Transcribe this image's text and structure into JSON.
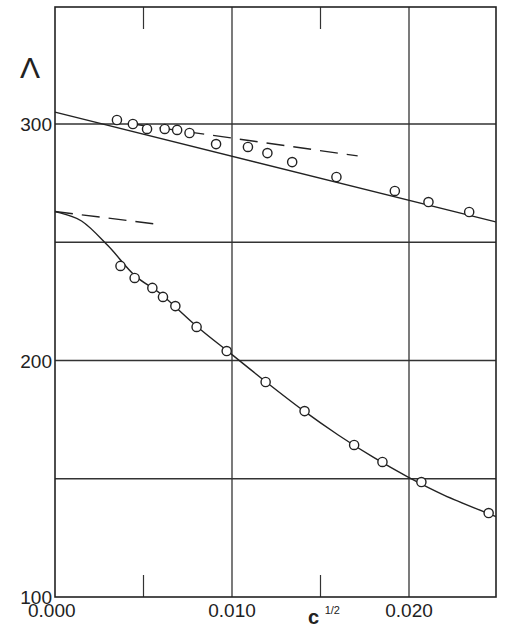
{
  "chart_data": {
    "type": "line",
    "title": "",
    "xlabel": "c^1/2",
    "xlabel_base": "c",
    "xlabel_sup": "1/2",
    "ylabel": "Λ",
    "xlim": [
      0.0,
      0.025
    ],
    "ylim": [
      100,
      350
    ],
    "grid": true,
    "legend": null,
    "x_ticks": [
      {
        "value": 0.0,
        "label": "0.000"
      },
      {
        "value": 0.01,
        "label": "0.010"
      },
      {
        "value": 0.02,
        "label": "0.020"
      }
    ],
    "x_minor_ticks": [
      0.005,
      0.015
    ],
    "y_ticks": [
      {
        "value": 100,
        "label": "100"
      },
      {
        "value": 200,
        "label": "200"
      },
      {
        "value": 300,
        "label": "300"
      }
    ],
    "y_gridlines": [
      150,
      250,
      300,
      200
    ],
    "x_gridlines": [
      0.01,
      0.02
    ],
    "series": [
      {
        "name": "upper-data",
        "marker": "open-circle",
        "x": [
          0.0035,
          0.0044,
          0.0052,
          0.0062,
          0.0069,
          0.0076,
          0.0091,
          0.0109,
          0.012,
          0.0134,
          0.0159,
          0.0192,
          0.0211,
          0.0234
        ],
        "y": [
          301.7,
          300.0,
          297.9,
          297.9,
          297.5,
          296.2,
          291.5,
          290.3,
          287.7,
          283.9,
          277.6,
          271.7,
          267.0,
          262.8
        ]
      },
      {
        "name": "upper-fit",
        "style": "solid",
        "x": [
          0.0,
          0.0249
        ],
        "y": [
          305.0,
          258.6
        ]
      },
      {
        "name": "upper-limiting-slope",
        "style": "dashed",
        "x": [
          0.0044,
          0.0171
        ],
        "y": [
          300.0,
          286.5
        ]
      },
      {
        "name": "lower-data",
        "marker": "open-circle",
        "x": [
          0.0037,
          0.0045,
          0.0055,
          0.0061,
          0.0068,
          0.008,
          0.0097,
          0.0119,
          0.0141,
          0.0169,
          0.0185,
          0.0207,
          0.0245
        ],
        "y": [
          240.0,
          234.9,
          230.7,
          226.9,
          223.0,
          214.2,
          204.0,
          190.9,
          178.6,
          164.3,
          157.1,
          148.6,
          135.5
        ]
      },
      {
        "name": "lower-fit",
        "style": "solid",
        "x": [
          0.0,
          0.0015,
          0.003,
          0.0045,
          0.006,
          0.008,
          0.01,
          0.012,
          0.014,
          0.016,
          0.018,
          0.02,
          0.022,
          0.0249
        ],
        "y": [
          263.0,
          259.0,
          248.5,
          236.0,
          228.0,
          214.5,
          202.5,
          190.5,
          179.0,
          168.5,
          159.0,
          150.5,
          143.0,
          134.0
        ]
      },
      {
        "name": "lower-limiting-slope",
        "style": "dashed",
        "x": [
          0.0,
          0.0057
        ],
        "y": [
          263.0,
          257.7
        ]
      }
    ]
  }
}
